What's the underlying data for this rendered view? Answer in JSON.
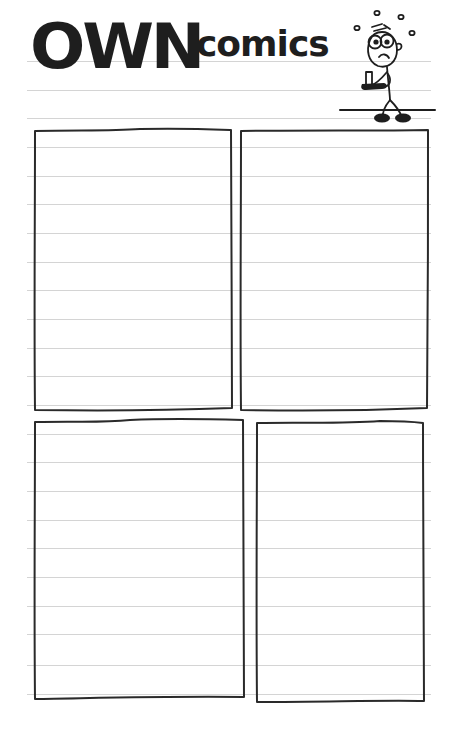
{
  "header": {
    "title_big": "OWN",
    "title_small": "comics",
    "mascot": "worried-stick-figure-icon"
  },
  "page": {
    "rule_color": "#d4d4d4",
    "ink_color": "#1e1e1e",
    "rule_positions": [
      61,
      90,
      118,
      147,
      176,
      204,
      233,
      262,
      290,
      319,
      348,
      376,
      405,
      434,
      462,
      491,
      520,
      548,
      577,
      606,
      634,
      665,
      694
    ]
  },
  "panels": [
    {
      "id": "panel-1",
      "x": 34,
      "y": 130,
      "w": 198,
      "h": 280
    },
    {
      "id": "panel-2",
      "x": 240,
      "y": 130,
      "w": 188,
      "h": 280
    },
    {
      "id": "panel-3",
      "x": 34,
      "y": 420,
      "w": 210,
      "h": 278
    },
    {
      "id": "panel-4",
      "x": 256,
      "y": 421,
      "w": 168,
      "h": 281
    }
  ]
}
